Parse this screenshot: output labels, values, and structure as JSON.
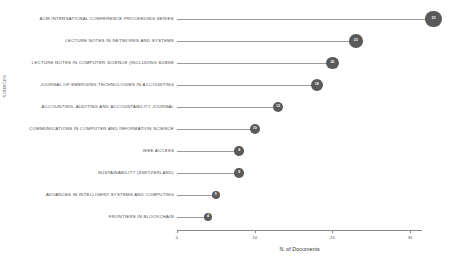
{
  "chart_data": {
    "type": "bar",
    "subtype": "lollipop-horizontal",
    "title": "",
    "xlabel": "N. of Documents",
    "ylabel": "SOURCES",
    "xlim": [
      0,
      33
    ],
    "xticks": [
      0,
      10,
      20,
      30
    ],
    "xtick_labels": [
      "0",
      "10",
      "20",
      "30"
    ],
    "grid": false,
    "legend": false,
    "marker_color": "#5a5a5a",
    "stem_color": "#9b9b9b",
    "categories": [
      "ACM INTERNATIONAL CONFERENCE PROCEEDING SERIES",
      "LECTURE NOTES IN NETWORKS AND SYSTEMS",
      "LECTURE NOTES IN COMPUTER SCIENCE (INCLUDING SUBSE",
      "JOURNAL OF EMERGING TECHNOLOGIES IN ACCOUNTING",
      "ACCOUNTING, AUDITING AND ACCOUNTABILITY JOURNAL",
      "COMMUNICATIONS IN COMPUTER AND INFORMATION SCIENCE",
      "IEEE ACCESS",
      "SUSTAINABILITY (SWITZERLAND)",
      "ADVANCES IN INTELLIGENT SYSTEMS AND COMPUTING",
      "FRONTIERS IN BLOCKCHAIN"
    ],
    "values": [
      33,
      23,
      20,
      18,
      13,
      10,
      8,
      8,
      5,
      4
    ]
  }
}
